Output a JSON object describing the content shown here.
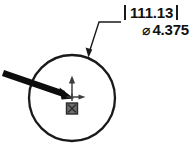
{
  "drawing": {
    "type": "cad-dimension-callout",
    "background_color": "#ffffff",
    "line_color": "#1a1a1a",
    "dimension": {
      "primary_value": "111.13",
      "primary_bracket_left": "|",
      "primary_bracket_right": "|",
      "diameter_symbol": "⌀",
      "secondary_value": "4.375"
    },
    "geometry": {
      "circle_name": "dimensioned-circle",
      "circle_center_x": 72,
      "circle_center_y": 98,
      "circle_radius": 43
    },
    "leader": {
      "name": "leader-line",
      "arrow_tip_x": 88,
      "arrow_tip_y": 56
    },
    "pointer": {
      "name": "pointer-arrow",
      "start_x": 3,
      "start_y": 73,
      "tip_x": 73,
      "tip_y": 97
    },
    "triad": {
      "name": "origin-triad",
      "origin_x": 72,
      "origin_y": 97,
      "y_axis_color": "#4d4d4d",
      "x_axis_color": "#4d4d4d",
      "origin_icon_color": "#555555"
    }
  }
}
